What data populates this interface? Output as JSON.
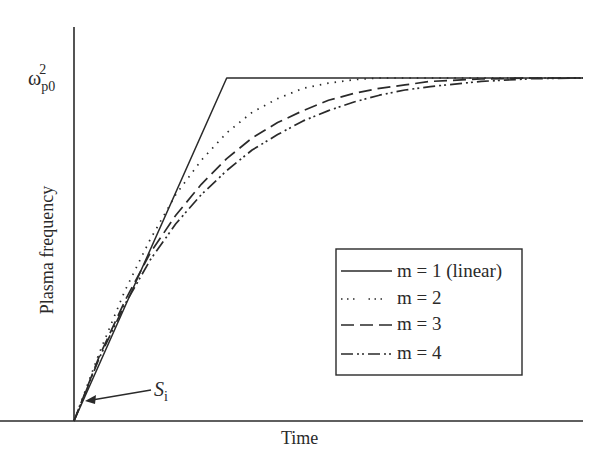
{
  "chart_data": {
    "type": "line",
    "title": "",
    "xlabel": "Time",
    "ylabel": "Plasma frequency",
    "y_ticks": [
      {
        "label": "ω_p0^2",
        "base": "ω",
        "sub": "p0",
        "sup": "2",
        "value": 1.0
      }
    ],
    "x_ticks": [],
    "grid": false,
    "legend_position": "lower right (inside plot)",
    "annotation": {
      "text": "S",
      "sub": "i",
      "points_to": "origin of curves (x=0, y=0)"
    },
    "xlim": [
      0,
      1
    ],
    "ylim": [
      0,
      1.0
    ],
    "series": [
      {
        "name": "m = 1 (linear)",
        "style": "solid",
        "x": [
          0,
          0.3,
          1.0
        ],
        "y": [
          0,
          1.0,
          1.0
        ]
      },
      {
        "name": "m = 2",
        "style": "dotted",
        "x": [
          0,
          0.05,
          0.1,
          0.15,
          0.2,
          0.25,
          0.3,
          0.35,
          0.4,
          0.45,
          0.5,
          0.55,
          0.6,
          0.65,
          0.7,
          0.8,
          0.9,
          1.0
        ],
        "y": [
          0,
          0.2,
          0.38,
          0.53,
          0.66,
          0.76,
          0.84,
          0.9,
          0.94,
          0.97,
          0.985,
          0.995,
          1.0,
          1.0,
          1.0,
          1.0,
          1.0,
          1.0
        ]
      },
      {
        "name": "m = 3",
        "style": "dashed",
        "x": [
          0,
          0.05,
          0.1,
          0.15,
          0.2,
          0.25,
          0.3,
          0.35,
          0.4,
          0.45,
          0.5,
          0.55,
          0.6,
          0.65,
          0.7,
          0.8,
          0.9,
          1.0
        ],
        "y": [
          0,
          0.19,
          0.35,
          0.49,
          0.6,
          0.69,
          0.765,
          0.825,
          0.87,
          0.905,
          0.935,
          0.955,
          0.97,
          0.98,
          0.99,
          0.997,
          1.0,
          1.0
        ]
      },
      {
        "name": "m = 4",
        "style": "dash-dot",
        "x": [
          0,
          0.05,
          0.1,
          0.15,
          0.2,
          0.25,
          0.3,
          0.35,
          0.4,
          0.45,
          0.5,
          0.55,
          0.6,
          0.65,
          0.7,
          0.8,
          0.9,
          1.0
        ],
        "y": [
          0,
          0.185,
          0.34,
          0.47,
          0.575,
          0.66,
          0.73,
          0.79,
          0.835,
          0.875,
          0.905,
          0.93,
          0.95,
          0.965,
          0.975,
          0.99,
          0.998,
          1.0
        ]
      }
    ]
  },
  "layout": {
    "plot_px": {
      "x0": 74,
      "x1": 583,
      "y0": 421,
      "y_top_value": 78,
      "yaxis_top": 27
    },
    "legend_box": {
      "x": 336,
      "y": 249,
      "w": 186,
      "h": 126
    },
    "colors": {
      "ink": "#2a2a2a",
      "background": "#ffffff"
    }
  }
}
